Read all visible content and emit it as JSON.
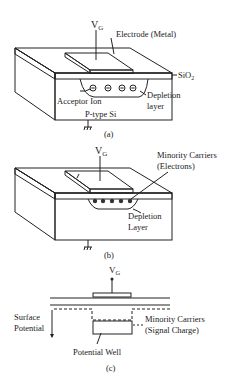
{
  "panel_a": {
    "gate_voltage": "V",
    "gate_voltage_sub": "G",
    "electrode": "Electrode (Metal)",
    "oxide": "SiO",
    "oxide_sub": "2",
    "acceptor": "Acceptor Ion",
    "depletion_1": "Depletion",
    "depletion_2": "layer",
    "substrate": "P-type Si",
    "caption": "(a)",
    "ion_symbol": "−"
  },
  "panel_b": {
    "gate_voltage": "V",
    "gate_voltage_sub": "G",
    "minority_1": "Minority Carriers",
    "minority_2": "(Electrons)",
    "depletion_1": "Depletion",
    "depletion_2": "Layer",
    "caption": "(b)"
  },
  "panel_c": {
    "gate_voltage": "V",
    "gate_voltage_sub": "G",
    "surface_1": "Surface",
    "surface_2": "Potential",
    "minority_1": "Minority Carriers",
    "minority_2": "(Signal Charge)",
    "well": "Potential Well",
    "caption": "(c)"
  }
}
